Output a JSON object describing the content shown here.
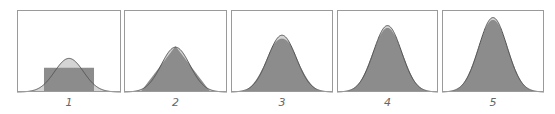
{
  "chart_data": {
    "type": "area",
    "title": "",
    "grid": false,
    "legend": null,
    "panels": [
      {
        "label": "1",
        "n": 1,
        "shape": "uniform",
        "peak_height_frac": 0.29,
        "normal_peak_frac": 0.42,
        "support": [
          -1.73,
          1.73
        ]
      },
      {
        "label": "2",
        "n": 2,
        "shape": "triangular",
        "peak_height_frac": 0.57,
        "normal_peak_frac": 0.56
      },
      {
        "label": "3",
        "n": 3,
        "shape": "piecewise-quadratic",
        "peak_height_frac": 0.7,
        "normal_peak_frac": 0.71
      },
      {
        "label": "4",
        "n": 4,
        "shape": "piecewise-cubic",
        "peak_height_frac": 0.83,
        "normal_peak_frac": 0.83
      },
      {
        "label": "5",
        "n": 5,
        "shape": "piecewise-quartic",
        "peak_height_frac": 0.93,
        "normal_peak_frac": 0.93
      }
    ],
    "xlabel": "",
    "ylabel": ""
  },
  "colors": {
    "frame": "#9a9a9a",
    "fill": "#8c8c8c",
    "normal_fill": "#d4d4d4",
    "curve": "#555555",
    "label": "#666666"
  },
  "layout": {
    "panels": [
      {
        "x": 17,
        "w": 104
      },
      {
        "x": 124,
        "w": 103
      },
      {
        "x": 231,
        "w": 102
      },
      {
        "x": 337,
        "w": 101
      },
      {
        "x": 442,
        "w": 102
      }
    ]
  }
}
